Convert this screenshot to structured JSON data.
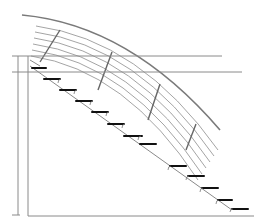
{
  "drawing": {
    "title": "Curved stair elevation line drawing",
    "colors": {
      "background": "#ffffff",
      "line": "#8a8a8a",
      "tread": "#111111"
    },
    "outer_arc": {
      "d": "M22 15 Q130 25 220 130"
    },
    "rails": [
      {
        "d": "M36 26 Q140 40 218 150"
      },
      {
        "d": "M35 32 Q138 46 214 156"
      },
      {
        "d": "M34 38 Q135 52 210 162"
      },
      {
        "d": "M33 44 Q132 58 206 168"
      },
      {
        "d": "M32 50 Q129 64 202 174"
      },
      {
        "d": "M31 56 Q126 70 198 180"
      }
    ],
    "braces": [
      {
        "x1": 60,
        "y1": 30,
        "x2": 40,
        "y2": 62
      },
      {
        "x1": 112,
        "y1": 52,
        "x2": 98,
        "y2": 90
      },
      {
        "x1": 160,
        "y1": 84,
        "x2": 148,
        "y2": 120
      },
      {
        "x1": 196,
        "y1": 124,
        "x2": 186,
        "y2": 150
      }
    ],
    "horizontal_lines": [
      {
        "x1": 12,
        "y1": 56,
        "x2": 222,
        "y2": 56
      },
      {
        "x1": 12,
        "y1": 72,
        "x2": 242,
        "y2": 72
      },
      {
        "x1": 28,
        "y1": 216,
        "x2": 254,
        "y2": 216
      }
    ],
    "post": {
      "x1": 18,
      "y1": 56,
      "x2": 18,
      "y2": 215,
      "x1b": 28,
      "x2b": 28
    },
    "stringer": {
      "x1": 30,
      "y1": 66,
      "x2": 232,
      "y2": 210
    },
    "treads": [
      {
        "x1": 32,
        "y1": 68,
        "x2": 46,
        "y2": 68
      },
      {
        "x1": 44,
        "y1": 79,
        "x2": 60,
        "y2": 79
      },
      {
        "x1": 60,
        "y1": 90,
        "x2": 76,
        "y2": 90
      },
      {
        "x1": 76,
        "y1": 101,
        "x2": 92,
        "y2": 101
      },
      {
        "x1": 92,
        "y1": 112,
        "x2": 108,
        "y2": 112
      },
      {
        "x1": 108,
        "y1": 124,
        "x2": 124,
        "y2": 124
      },
      {
        "x1": 124,
        "y1": 136,
        "x2": 142,
        "y2": 136
      },
      {
        "x1": 140,
        "y1": 144,
        "x2": 156,
        "y2": 144
      },
      {
        "x1": 170,
        "y1": 166,
        "x2": 186,
        "y2": 166
      },
      {
        "x1": 188,
        "y1": 176,
        "x2": 204,
        "y2": 176
      },
      {
        "x1": 202,
        "y1": 188,
        "x2": 218,
        "y2": 188
      },
      {
        "x1": 218,
        "y1": 200,
        "x2": 232,
        "y2": 200
      },
      {
        "x1": 232,
        "y1": 209,
        "x2": 248,
        "y2": 209
      }
    ]
  }
}
